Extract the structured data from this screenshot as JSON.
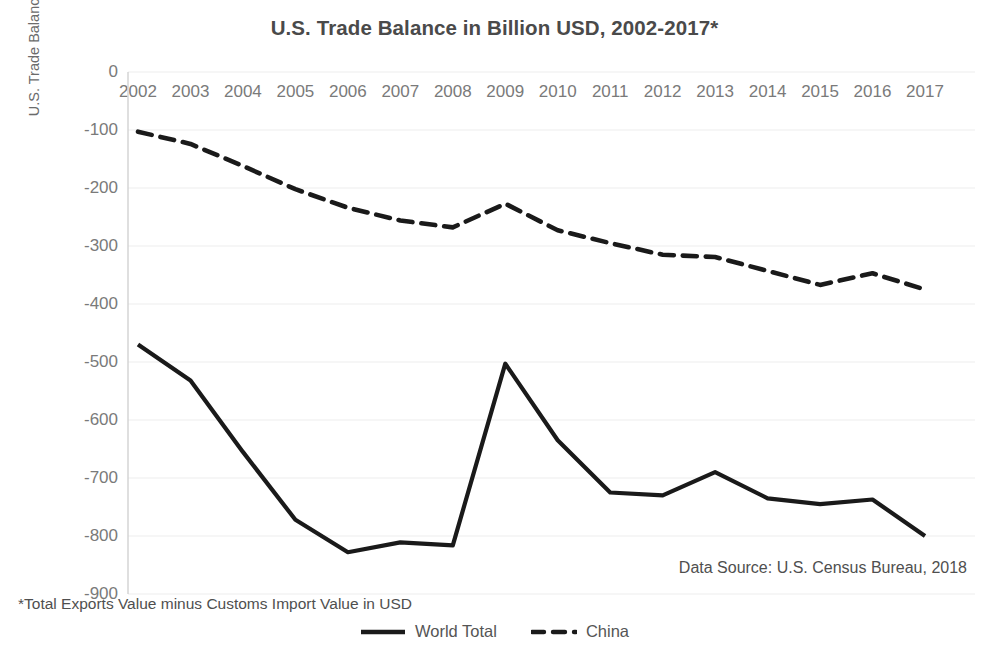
{
  "chart_data": {
    "type": "line",
    "title": "U.S. Trade Balance in Billion USD, 2002-2017*",
    "xlabel": "",
    "ylabel": "U.S. Trade Balance in Billion USD",
    "categories": [
      "2002",
      "2003",
      "2004",
      "2005",
      "2006",
      "2007",
      "2008",
      "2009",
      "2010",
      "2011",
      "2012",
      "2013",
      "2014",
      "2015",
      "2016",
      "2017"
    ],
    "ylim": [
      -900,
      0
    ],
    "ytick_labels": [
      "0",
      "-100",
      "-200",
      "-300",
      "-400",
      "-500",
      "-600",
      "-700",
      "-800",
      "-900"
    ],
    "ytick_values": [
      0,
      -100,
      -200,
      -300,
      -400,
      -500,
      -600,
      -700,
      -800,
      -900
    ],
    "grid": true,
    "legend_position": "bottom",
    "series": [
      {
        "name": "World Total",
        "style": "solid",
        "color": "#1a1a1a",
        "values": [
          -470,
          -532,
          -655,
          -772,
          -828,
          -811,
          -816,
          -503,
          -635,
          -725,
          -730,
          -690,
          -735,
          -745,
          -737,
          -800
        ]
      },
      {
        "name": "China",
        "style": "dashed",
        "color": "#1a1a1a",
        "values": [
          -103,
          -124,
          -162,
          -202,
          -234,
          -256,
          -268,
          -227,
          -273,
          -295,
          -315,
          -319,
          -343,
          -367,
          -347,
          -375
        ]
      }
    ],
    "annotations": {
      "source": "Data Source: U.S. Census Bureau, 2018",
      "footnote": "*Total Exports Value minus Customs Import Value in USD"
    }
  }
}
